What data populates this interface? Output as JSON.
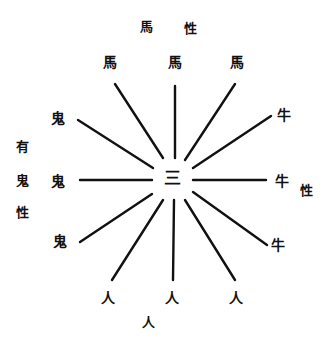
{
  "diagram": {
    "type": "radial",
    "reading_notes": "Printed glyphs are heavily blurred. Confident readings: 馬, 牛, 人, 三, 性. The left-group ring glyph is rendered as 鬼 as a best guess; the first left-label glyph (rendered 有) is also a best guess. Neither is a confirmed reading.",
    "center": {
      "char": "三",
      "x": 172,
      "y": 178
    },
    "line_color": "#111111",
    "groups": [
      {
        "name": "top",
        "label": {
          "chars": [
            "馬",
            "性"
          ],
          "positions": [
            [
              146,
              26
            ],
            [
              190,
              28
            ]
          ]
        },
        "nodes": [
          {
            "char": "馬",
            "x": 110,
            "y": 62
          },
          {
            "char": "馬",
            "x": 175,
            "y": 62
          },
          {
            "char": "馬",
            "x": 237,
            "y": 62
          }
        ]
      },
      {
        "name": "right",
        "label": {
          "chars": [
            "性"
          ],
          "positions": [
            [
              306,
              190
            ]
          ]
        },
        "nodes": [
          {
            "char": "牛",
            "x": 284,
            "y": 115
          },
          {
            "char": "牛",
            "x": 282,
            "y": 181
          },
          {
            "char": "牛",
            "x": 278,
            "y": 245
          }
        ]
      },
      {
        "name": "bottom",
        "label": {
          "chars": [
            "人"
          ],
          "positions": [
            [
              148,
              322
            ]
          ]
        },
        "nodes": [
          {
            "char": "人",
            "x": 108,
            "y": 298
          },
          {
            "char": "人",
            "x": 172,
            "y": 298
          },
          {
            "char": "人",
            "x": 236,
            "y": 298
          }
        ]
      },
      {
        "name": "left",
        "label": {
          "chars": [
            "有",
            "鬼",
            "性"
          ],
          "positions": [
            [
              22,
              146
            ],
            [
              22,
              180
            ],
            [
              22,
              212
            ]
          ],
          "uncertain": true
        },
        "nodes": [
          {
            "char": "鬼",
            "x": 58,
            "y": 118,
            "uncertain": true
          },
          {
            "char": "鬼",
            "x": 58,
            "y": 181,
            "uncertain": true
          },
          {
            "char": "鬼",
            "x": 60,
            "y": 241,
            "uncertain": true
          }
        ]
      }
    ],
    "lines": [
      {
        "x1": 115,
        "y1": 84,
        "x2": 163,
        "y2": 158
      },
      {
        "x1": 175,
        "y1": 86,
        "x2": 175,
        "y2": 158
      },
      {
        "x1": 235,
        "y1": 84,
        "x2": 185,
        "y2": 160
      },
      {
        "x1": 271,
        "y1": 116,
        "x2": 193,
        "y2": 168
      },
      {
        "x1": 193,
        "y1": 180,
        "x2": 266,
        "y2": 180
      },
      {
        "x1": 193,
        "y1": 192,
        "x2": 267,
        "y2": 245
      },
      {
        "x1": 185,
        "y1": 200,
        "x2": 235,
        "y2": 280
      },
      {
        "x1": 174,
        "y1": 200,
        "x2": 173,
        "y2": 280
      },
      {
        "x1": 163,
        "y1": 200,
        "x2": 112,
        "y2": 280
      },
      {
        "x1": 152,
        "y1": 194,
        "x2": 80,
        "y2": 242
      },
      {
        "x1": 80,
        "y1": 180,
        "x2": 152,
        "y2": 180
      },
      {
        "x1": 78,
        "y1": 120,
        "x2": 153,
        "y2": 168
      }
    ]
  }
}
